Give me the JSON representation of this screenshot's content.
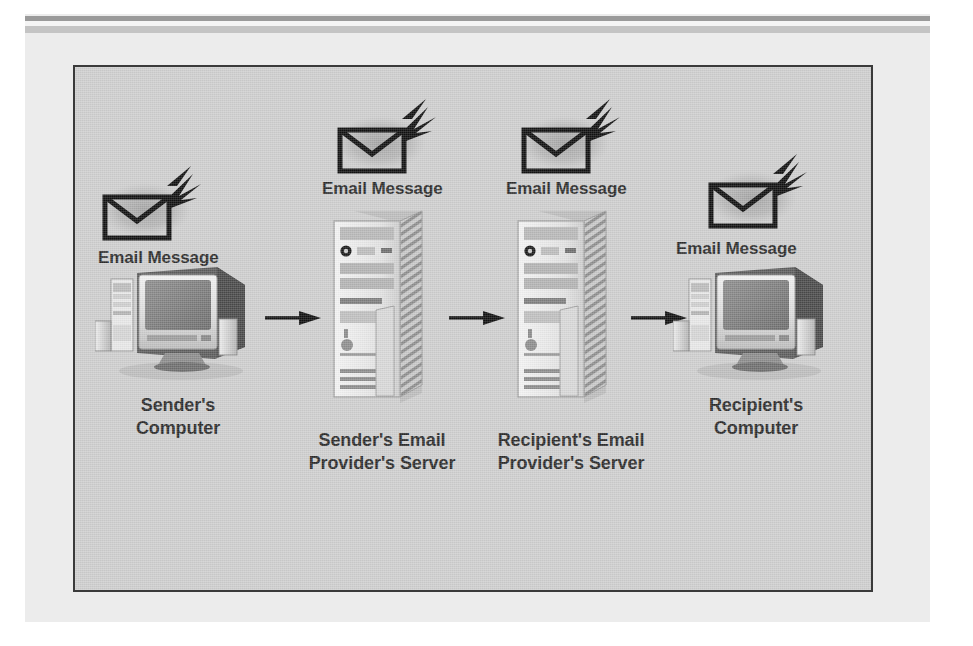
{
  "figure": {
    "background_color": "#cfcfcf",
    "plate_color": "#ececec",
    "border_color": "#3a3a3a",
    "ink_color": "#2b2b2b"
  },
  "message_labels": {
    "sender": "Email Message",
    "server1": "Email Message",
    "server2": "Email Message",
    "recipient": "Email Message"
  },
  "nodes": [
    {
      "id": "sender-computer",
      "label": "Sender's\nComputer",
      "icon": "desktop-computer"
    },
    {
      "id": "sender-server",
      "label": "Sender's Email\nProvider's Server",
      "icon": "server-tower"
    },
    {
      "id": "recipient-server",
      "label": "Recipient's Email\nProvider's Server",
      "icon": "server-tower"
    },
    {
      "id": "recipient-computer",
      "label": "Recipient's\nComputer",
      "icon": "desktop-computer"
    }
  ],
  "flow": {
    "arrow_count": 3,
    "direction": "left-to-right",
    "arrow_color": "#111111"
  },
  "icons": {
    "envelope": "envelope-with-lightning-icon",
    "computer": "desktop-computer-icon",
    "server": "server-tower-icon",
    "arrow": "right-arrow-icon"
  }
}
